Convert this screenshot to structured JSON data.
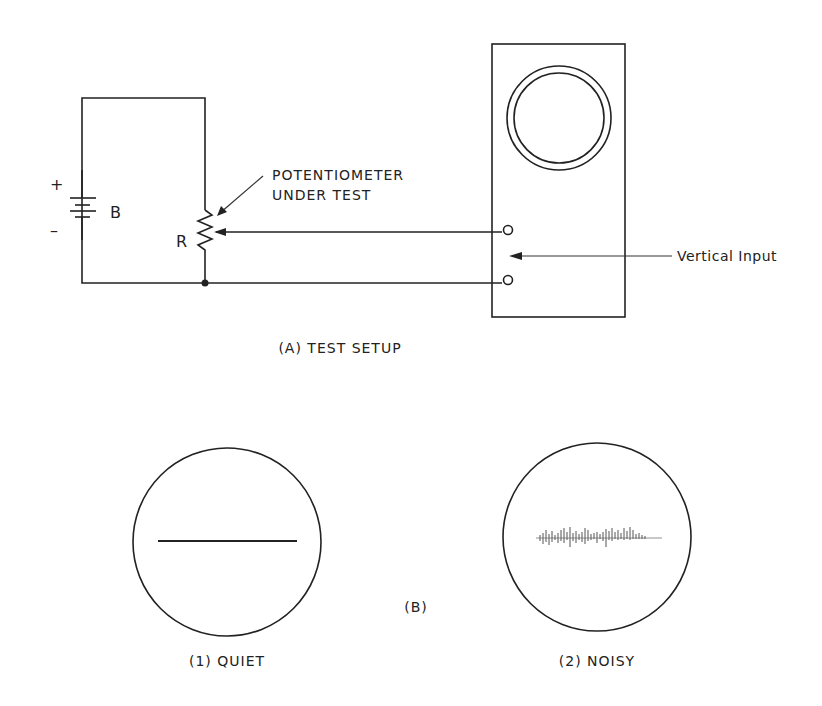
{
  "diagram": {
    "part_a": {
      "caption": "(A) TEST SETUP",
      "battery": {
        "label": "B",
        "plus": "+",
        "minus": "–"
      },
      "potentiometer": {
        "label": "R",
        "callout_line1": "POTENTIOMETER",
        "callout_line2": "UNDER TEST"
      },
      "oscilloscope": {
        "input_label": "Vertical Input"
      }
    },
    "part_b": {
      "caption": "(B)",
      "quiet": {
        "caption": "(1) QUIET"
      },
      "noisy": {
        "caption": "(2) NOISY"
      }
    },
    "colors": {
      "ink": "#222222",
      "background": "#ffffff"
    }
  }
}
